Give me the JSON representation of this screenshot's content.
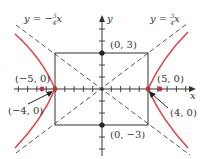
{
  "diagram": {
    "type": "hyperbola",
    "equation_asymptote_left": "y = −",
    "asymptote_left_frac_num": "3",
    "asymptote_left_frac_den": "4",
    "asymptote_left_var": "x",
    "equation_asymptote_right": "y = ",
    "asymptote_right_frac_num": "3",
    "asymptote_right_frac_den": "4",
    "asymptote_right_var": "x",
    "axis_x_label": "x",
    "axis_y_label": "y",
    "points": {
      "top": "(0, 3)",
      "bottom": "(0, −3)",
      "left_vertex": "(−5, 0)",
      "right_vertex": "(5, 0)",
      "left_focus": "(−4, 0)",
      "right_focus": "(4, 0)"
    },
    "colors": {
      "curve": "#e0454a",
      "axes": "#333333",
      "dashed": "#444444"
    }
  }
}
